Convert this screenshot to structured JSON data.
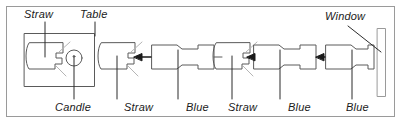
{
  "panel": {
    "border_color": "#9a9a9a",
    "background": "#ffffff",
    "stroke_color": "#555555",
    "text_color": "#1a1a1a"
  },
  "labels": {
    "top": [
      {
        "id": "straw-top",
        "text": "Straw",
        "x": 24,
        "y": 8
      },
      {
        "id": "table-top",
        "text": "Table",
        "x": 80,
        "y": 8
      },
      {
        "id": "window-top",
        "text": "Window",
        "x": 325,
        "y": 10
      }
    ],
    "bottom": [
      {
        "id": "candle-bottom",
        "text": "Candle",
        "x": 58,
        "y": 103
      },
      {
        "id": "straw-bottom-1",
        "text": "Straw",
        "x": 126,
        "y": 103
      },
      {
        "id": "blue-bottom-1",
        "text": "Blue",
        "x": 185,
        "y": 103
      },
      {
        "id": "straw-bottom-2",
        "text": "Straw",
        "x": 228,
        "y": 103
      },
      {
        "id": "blue-bottom-2",
        "text": "Blue",
        "x": 287,
        "y": 103
      },
      {
        "id": "blue-bottom-3",
        "text": "Blue",
        "x": 345,
        "y": 103
      }
    ]
  },
  "shapes": {
    "table_box": {
      "name": "table-enclosure",
      "x": 24,
      "y": 33,
      "width": 70,
      "height": 53
    },
    "straw_blocks": [
      {
        "name": "straw-block-in-table",
        "x": 28,
        "y": 42,
        "width": 38,
        "height": 26
      },
      {
        "name": "straw-block-1",
        "x": 100,
        "y": 42,
        "width": 38,
        "height": 26
      },
      {
        "name": "straw-block-2",
        "x": 215,
        "y": 42,
        "width": 38,
        "height": 26
      }
    ],
    "blue_blocks": [
      {
        "name": "blue-block-1",
        "x": 152,
        "y": 44,
        "width": 62,
        "height": 24
      },
      {
        "name": "blue-block-2",
        "x": 254,
        "y": 44,
        "width": 62,
        "height": 24
      },
      {
        "name": "blue-block-3",
        "x": 312,
        "y": 44,
        "width": 62,
        "height": 24
      }
    ],
    "candle": {
      "name": "candle-circle",
      "cx": 74,
      "cy": 58,
      "r": 8
    },
    "window": {
      "name": "window-bar",
      "x": 377,
      "y": 28,
      "width": 8,
      "height": 68
    },
    "arrows": [
      {
        "name": "arrow-1",
        "from_x": 152,
        "to_x": 134,
        "y": 57
      },
      {
        "name": "arrow-2",
        "from_x": 254,
        "to_x": 248,
        "y": 57
      },
      {
        "name": "arrow-3",
        "from_x": 312,
        "to_x": 306,
        "y": 57
      }
    ]
  }
}
